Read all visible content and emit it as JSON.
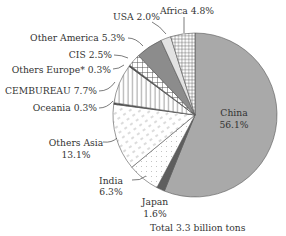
{
  "chart_data": {
    "type": "pie",
    "title": "",
    "footnote": "Total 3.3 billion tons",
    "start": "top",
    "direction": "counter-clockwise-from-top-after-china",
    "slices": [
      {
        "name": "China",
        "value": 56.1,
        "label": "China",
        "pct_label": "56.1%",
        "fill": "#a9a9a9",
        "pattern": "solid"
      },
      {
        "name": "Japan",
        "value": 1.6,
        "label": "Japan",
        "pct_label": "1.6%",
        "fill": "#5e5e5e",
        "pattern": "solid"
      },
      {
        "name": "India",
        "value": 6.3,
        "label": "India",
        "pct_label": "6.3%",
        "fill": "#ffffff",
        "pattern": "dots"
      },
      {
        "name": "Others Asia",
        "value": 13.1,
        "label": "Others Asia",
        "pct_label": "13.1%",
        "fill": "#ffffff",
        "pattern": "dashes"
      },
      {
        "name": "Oceania",
        "value": 0.3,
        "label": "Oceania 0.3%",
        "fill": "#4a4a4a",
        "pattern": "solid"
      },
      {
        "name": "CEMBUREAU",
        "value": 7.7,
        "label": "CEMBUREAU 7.7%",
        "fill": "#ffffff",
        "pattern": "vertical-lines"
      },
      {
        "name": "Others Europe*",
        "value": 0.3,
        "label": "Others Europe* 0.3%",
        "fill": "#4a4a4a",
        "pattern": "solid"
      },
      {
        "name": "CIS",
        "value": 2.5,
        "label": "CIS 2.5%",
        "fill": "#ffffff",
        "pattern": "crosshatch"
      },
      {
        "name": "Other America",
        "value": 5.3,
        "label": "Other America 5.3%",
        "fill": "#8c8c8c",
        "pattern": "solid"
      },
      {
        "name": "USA",
        "value": 2.0,
        "label": "USA 2.0%",
        "fill": "#e2e2e2",
        "pattern": "solid"
      },
      {
        "name": "Africa",
        "value": 4.8,
        "label": "Africa 4.8%",
        "fill": "#ffffff",
        "pattern": "fine-grid"
      }
    ]
  }
}
